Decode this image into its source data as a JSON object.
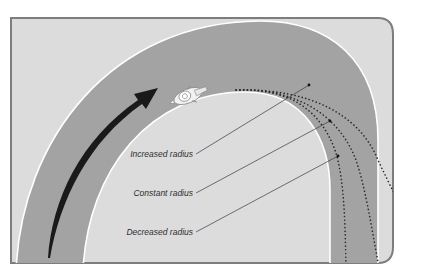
{
  "diagram": {
    "colors": {
      "page_background": "#ffffff",
      "panel_fill": "#dcdcdc",
      "panel_border": "#7d7d7d",
      "road_fill": "#a3a3a3",
      "road_edge_line": "#ffffff",
      "arrow": "#1a1a1a",
      "dotted_path": "#2a2a2a",
      "leader_line": "#3a3a3a"
    },
    "elements": {
      "motorcycle": "motorcycle-rider-icon",
      "direction_arrow": "direction-arrow"
    },
    "labels": [
      {
        "id": "increased",
        "text": "Increased radius"
      },
      {
        "id": "constant",
        "text": "Constant radius"
      },
      {
        "id": "decreased",
        "text": "Decreased radius"
      }
    ]
  }
}
